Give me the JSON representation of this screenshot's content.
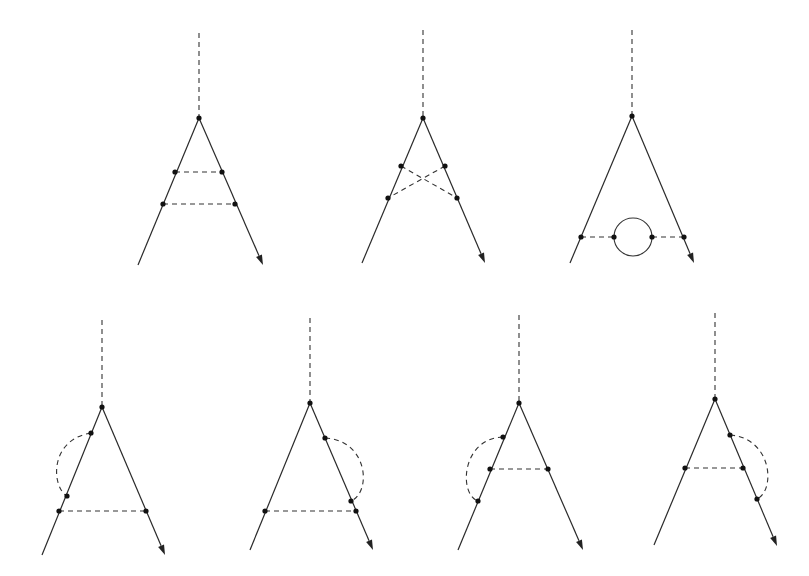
{
  "figure": {
    "colors": {
      "line": "#2a2a2a",
      "dashed": "#333333",
      "dot": "#111111",
      "background": "#ffffff"
    }
  },
  "diagrams": [
    {
      "id": "ladder",
      "row": 1,
      "external_dashed": [
        [
          199,
          33
        ],
        [
          199,
          118
        ]
      ],
      "vertex": [
        199,
        118
      ],
      "left_leg_end": [
        138,
        265
      ],
      "right_leg_end": [
        263,
        265
      ],
      "dots": [
        [
          199,
          118
        ],
        [
          175,
          172
        ],
        [
          222,
          172
        ],
        [
          163,
          204
        ],
        [
          235,
          204
        ]
      ],
      "dashed_lines": [
        [
          [
            175,
            172
          ],
          [
            222,
            172
          ]
        ],
        [
          [
            163,
            204
          ],
          [
            235,
            204
          ]
        ]
      ],
      "arcs": [],
      "loops": []
    },
    {
      "id": "crossed-ladder",
      "row": 1,
      "external_dashed": [
        [
          423,
          30
        ],
        [
          423,
          118
        ]
      ],
      "vertex": [
        423,
        118
      ],
      "left_leg_end": [
        362,
        263
      ],
      "right_leg_end": [
        485,
        263
      ],
      "dots": [
        [
          423,
          118
        ],
        [
          401,
          166
        ],
        [
          445,
          166
        ],
        [
          388,
          198
        ],
        [
          457,
          198
        ]
      ],
      "dashed_lines": [
        [
          [
            401,
            166
          ],
          [
            457,
            198
          ]
        ],
        [
          [
            445,
            166
          ],
          [
            388,
            198
          ]
        ]
      ],
      "arcs": [],
      "loops": []
    },
    {
      "id": "vacuum-polarization",
      "row": 1,
      "external_dashed": [
        [
          632,
          30
        ],
        [
          632,
          116
        ]
      ],
      "vertex": [
        632,
        116
      ],
      "left_leg_end": [
        570,
        263
      ],
      "right_leg_end": [
        694,
        263
      ],
      "dots": [
        [
          632,
          116
        ],
        [
          581,
          237
        ],
        [
          614,
          237
        ],
        [
          652,
          237
        ],
        [
          684,
          237
        ]
      ],
      "dashed_lines": [
        [
          [
            581,
            237
          ],
          [
            614,
            237
          ]
        ],
        [
          [
            652,
            237
          ],
          [
            684,
            237
          ]
        ]
      ],
      "arcs": [],
      "loops": [
        {
          "center": [
            633,
            237
          ],
          "r": 19
        }
      ]
    },
    {
      "id": "self-energy-left-outer",
      "row": 2,
      "external_dashed": [
        [
          102,
          320
        ],
        [
          102,
          407
        ]
      ],
      "vertex": [
        102,
        407
      ],
      "left_leg_end": [
        42,
        555
      ],
      "right_leg_end": [
        165,
        555
      ],
      "dots": [
        [
          102,
          407
        ],
        [
          91,
          433
        ],
        [
          67,
          496
        ],
        [
          59,
          511
        ],
        [
          146,
          511
        ]
      ],
      "dashed_lines": [
        [
          [
            59,
            511
          ],
          [
            146,
            511
          ]
        ]
      ],
      "arcs": [
        {
          "from": [
            91,
            433
          ],
          "to": [
            67,
            496
          ],
          "ctrl": [
            48,
            440
          ],
          "ctrl2": [
            52,
            488
          ]
        }
      ],
      "loops": []
    },
    {
      "id": "self-energy-right-outer",
      "row": 2,
      "external_dashed": [
        [
          310,
          318
        ],
        [
          310,
          403
        ]
      ],
      "vertex": [
        310,
        403
      ],
      "left_leg_end": [
        250,
        550
      ],
      "right_leg_end": [
        373,
        550
      ],
      "dots": [
        [
          310,
          403
        ],
        [
          325,
          438
        ],
        [
          351,
          501
        ],
        [
          265,
          511
        ],
        [
          356,
          511
        ]
      ],
      "dashed_lines": [
        [
          [
            265,
            511
          ],
          [
            356,
            511
          ]
        ]
      ],
      "arcs": [
        {
          "from": [
            325,
            438
          ],
          "to": [
            351,
            501
          ],
          "ctrl": [
            368,
            440
          ],
          "ctrl2": [
            372,
            492
          ]
        }
      ],
      "loops": []
    },
    {
      "id": "self-energy-left-inner",
      "row": 2,
      "external_dashed": [
        [
          519,
          315
        ],
        [
          519,
          403
        ]
      ],
      "vertex": [
        519,
        403
      ],
      "left_leg_end": [
        458,
        550
      ],
      "right_leg_end": [
        583,
        550
      ],
      "dots": [
        [
          519,
          403
        ],
        [
          503,
          437
        ],
        [
          490,
          469
        ],
        [
          548,
          469
        ],
        [
          478,
          501
        ]
      ],
      "dashed_lines": [
        [
          [
            490,
            469
          ],
          [
            548,
            469
          ]
        ]
      ],
      "arcs": [
        {
          "from": [
            503,
            437
          ],
          "to": [
            478,
            501
          ],
          "ctrl": [
            462,
            438
          ],
          "ctrl2": [
            458,
            494
          ]
        }
      ],
      "loops": []
    },
    {
      "id": "self-energy-right-inner",
      "row": 2,
      "external_dashed": [
        [
          715,
          313
        ],
        [
          715,
          399
        ]
      ],
      "vertex": [
        715,
        399
      ],
      "left_leg_end": [
        654,
        545
      ],
      "right_leg_end": [
        777,
        546
      ],
      "dots": [
        [
          715,
          399
        ],
        [
          730,
          435
        ],
        [
          685,
          468
        ],
        [
          743,
          468
        ],
        [
          757,
          499
        ]
      ],
      "dashed_lines": [
        [
          [
            685,
            468
          ],
          [
            743,
            468
          ]
        ]
      ],
      "arcs": [
        {
          "from": [
            730,
            435
          ],
          "to": [
            757,
            499
          ],
          "ctrl": [
            772,
            438
          ],
          "ctrl2": [
            776,
            490
          ]
        }
      ],
      "loops": []
    }
  ]
}
